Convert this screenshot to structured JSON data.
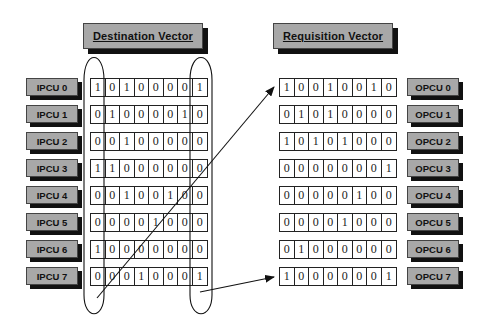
{
  "headers": {
    "destination": "Destination Vector",
    "requisition": "Requisition Vector"
  },
  "ipcu_labels": [
    "IPCU 0",
    "IPCU 1",
    "IPCU 2",
    "IPCU 3",
    "IPCU 4",
    "IPCU 5",
    "IPCU 6",
    "IPCU 7"
  ],
  "opcu_labels": [
    "OPCU 0",
    "OPCU 1",
    "OPCU 2",
    "OPCU 3",
    "OPCU 4",
    "OPCU 5",
    "OPCU 6",
    "OPCU 7"
  ],
  "destination_vector": [
    [
      "1",
      "0",
      "1",
      "0",
      "0",
      "0",
      "0",
      "1"
    ],
    [
      "0",
      "1",
      "0",
      "0",
      "0",
      "0",
      "1",
      "0"
    ],
    [
      "0",
      "0",
      "1",
      "0",
      "0",
      "0",
      "0",
      "0"
    ],
    [
      "1",
      "1",
      "0",
      "0",
      "0",
      "0",
      "0",
      "0"
    ],
    [
      "0",
      "0",
      "1",
      "0",
      "0",
      "1",
      "0",
      "0"
    ],
    [
      "0",
      "0",
      "0",
      "0",
      "1",
      "0",
      "0",
      "0"
    ],
    [
      "1",
      "0",
      "0",
      "0",
      "0",
      "0",
      "0",
      "0"
    ],
    [
      "0",
      "0",
      "0",
      "1",
      "0",
      "0",
      "0",
      "1"
    ]
  ],
  "requisition_vector": [
    [
      "1",
      "0",
      "0",
      "1",
      "0",
      "0",
      "1",
      "0"
    ],
    [
      "0",
      "1",
      "0",
      "1",
      "0",
      "0",
      "0",
      "0"
    ],
    [
      "1",
      "0",
      "1",
      "0",
      "1",
      "0",
      "0",
      "0"
    ],
    [
      "0",
      "0",
      "0",
      "0",
      "0",
      "0",
      "0",
      "1"
    ],
    [
      "0",
      "0",
      "0",
      "0",
      "0",
      "1",
      "0",
      "0"
    ],
    [
      "0",
      "0",
      "0",
      "0",
      "1",
      "0",
      "0",
      "0"
    ],
    [
      "0",
      "1",
      "0",
      "0",
      "0",
      "0",
      "0",
      "0"
    ],
    [
      "1",
      "0",
      "0",
      "0",
      "0",
      "0",
      "0",
      "1"
    ]
  ],
  "colors": {
    "box_fill": "#a8a8a8",
    "shadow": "#111111",
    "line": "#222222"
  }
}
